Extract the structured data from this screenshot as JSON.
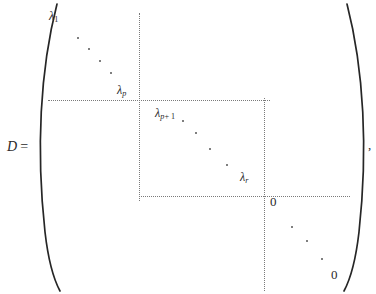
{
  "figure": {
    "name": "block-diagonal-matrix-D",
    "lhs": {
      "symbol": "D",
      "equals": "="
    },
    "trailing_punctuation": ",",
    "brackets": {
      "left": "(",
      "right": ")",
      "color": "#262626"
    },
    "labels": [
      {
        "id": "lambda-1",
        "base": "λ",
        "sub": "1",
        "text": "λ₁",
        "x": 49,
        "y": 10
      },
      {
        "id": "lambda-p",
        "base": "λ",
        "sub": "p",
        "text": "λₚ",
        "x": 117,
        "y": 84
      },
      {
        "id": "lambda-p-plus-1",
        "base": "λ",
        "sub": "p + 1",
        "text": "λₚ₊₁",
        "x": 155,
        "y": 107
      },
      {
        "id": "lambda-r",
        "base": "λ",
        "sub": "r",
        "text": "λᵣ",
        "x": 240,
        "y": 171
      },
      {
        "id": "zero-upper",
        "base": "0",
        "sub": "",
        "text": "0",
        "x": 270,
        "y": 195
      },
      {
        "id": "zero-lower",
        "base": "0",
        "sub": "",
        "text": "0",
        "x": 331,
        "y": 268
      }
    ],
    "subscripts": {
      "one": "1",
      "p": "p",
      "p_plus_1_p": "p",
      "p_plus_1_rest": "+ 1",
      "r": "r"
    },
    "zeros": {
      "upper_right": "0",
      "lower_right": "0"
    },
    "partition_lines": {
      "color": "#7a7a7a",
      "style": "dotted",
      "horizontal": [
        {
          "id": "h-upper",
          "x": 48,
          "y": 100,
          "length": 222
        },
        {
          "id": "h-lower",
          "x": 139,
          "y": 196,
          "length": 211
        }
      ],
      "vertical": [
        {
          "id": "v-left",
          "x": 139,
          "y": 13,
          "length": 188
        },
        {
          "id": "v-right",
          "x": 264,
          "y": 98,
          "length": 193
        }
      ]
    },
    "ellipsis_dots": {
      "block_1": [
        [
          77,
          37
        ],
        [
          88,
          48
        ],
        [
          99,
          60
        ],
        [
          110,
          72
        ]
      ],
      "block_2": [
        [
          182,
          120
        ],
        [
          195,
          132
        ],
        [
          209,
          148
        ],
        [
          226,
          164
        ]
      ],
      "block_3": [
        [
          291,
          226
        ],
        [
          306,
          240
        ],
        [
          321,
          258
        ]
      ]
    }
  }
}
